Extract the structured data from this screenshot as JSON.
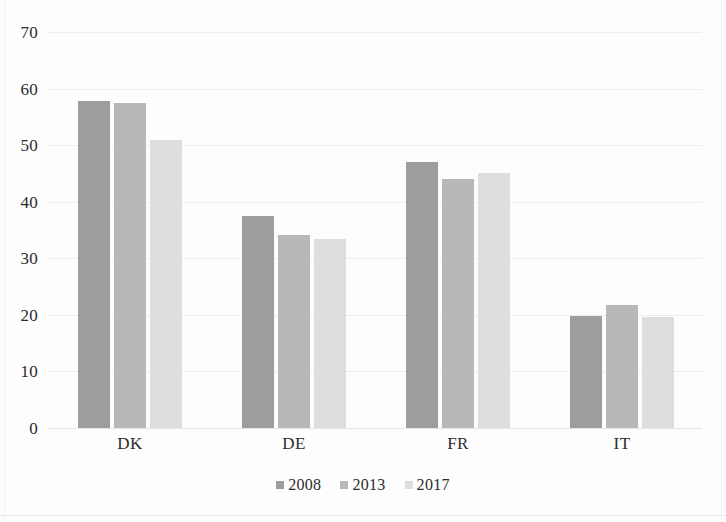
{
  "chart_data": {
    "type": "bar",
    "title": "",
    "subtitle": "",
    "xlabel": "",
    "ylabel": "",
    "categories": [
      "DK",
      "DE",
      "FR",
      "IT"
    ],
    "series": [
      {
        "name": "2008",
        "color": "#9d9d9d",
        "values": [
          57.8,
          37.5,
          47.0,
          19.8
        ]
      },
      {
        "name": "2013",
        "color": "#b8b8b8",
        "values": [
          57.4,
          34.2,
          44.0,
          21.8
        ]
      },
      {
        "name": "2017",
        "color": "#dedede",
        "values": [
          51.0,
          33.5,
          45.1,
          19.6
        ]
      }
    ],
    "ylim": [
      0,
      70
    ],
    "yticks": [
      70,
      60,
      50,
      40,
      30,
      20,
      10,
      0
    ],
    "ytick_labels": [
      "70",
      "60",
      "50",
      "40",
      "30",
      "20",
      "10",
      "0"
    ],
    "grid": true,
    "grid_axis": "y",
    "legend": [
      "2008",
      "2013",
      "2017"
    ],
    "legend_position": "bottom",
    "background_color": "#fdfdfd",
    "gridline_color": "#ededed",
    "text_color": "#2b2b2b"
  }
}
